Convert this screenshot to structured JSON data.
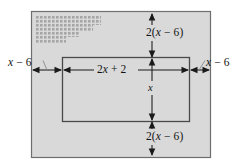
{
  "figure": {
    "colors": {
      "shaded_region": "#d9d9d9",
      "outline": "#6e6e6e",
      "inner_outline": "#4a4a4a",
      "arrow": "#1a1a1a",
      "leader_line": "#7a7a7a",
      "background": "#ffffff",
      "pattern_dots": "#a8a8a8"
    },
    "outer_rect": {
      "name": "outer-shaded-rectangle",
      "x": 31,
      "y": 11,
      "width": 180,
      "height": 147
    },
    "inner_rect": {
      "name": "inner-white-rectangle",
      "x": 62,
      "y": 57,
      "width": 128,
      "height": 65
    },
    "labels": {
      "top": {
        "name": "top-border-label",
        "expression": "2(x − 6)",
        "lead": "2(",
        "variable": "x",
        "middle": " − 6)",
        "tail": ""
      },
      "bottom": {
        "name": "bottom-border-label",
        "expression": "2(x − 6)",
        "lead": "2(",
        "variable": "x",
        "middle": " − 6)",
        "tail": ""
      },
      "left": {
        "name": "left-border-label",
        "expression": "x − 6",
        "lead": "",
        "variable": "x",
        "middle": " − 6",
        "tail": ""
      },
      "right": {
        "name": "right-border-label",
        "expression": "x − 6",
        "lead": "",
        "variable": "x",
        "middle": " − 6",
        "tail": ""
      },
      "inner_width": {
        "name": "inner-width-label",
        "expression": "2x + 2",
        "lead": "2",
        "variable": "x",
        "middle": " + 2",
        "tail": ""
      },
      "inner_height": {
        "name": "inner-height-label",
        "expression": "x",
        "lead": "",
        "variable": "x",
        "middle": "",
        "tail": ""
      }
    }
  }
}
